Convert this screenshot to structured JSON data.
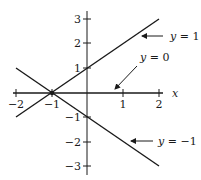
{
  "diagram": {
    "type": "coordinate-plot",
    "x_axis": {
      "label": "x",
      "ticks": [
        -2,
        -1,
        1,
        2
      ],
      "tick_labels": [
        "−2",
        "−1",
        "1",
        "2"
      ]
    },
    "y_axis": {
      "ticks": [
        3,
        2,
        1,
        -1,
        -2,
        -3
      ],
      "tick_labels": [
        "3",
        "2",
        "1",
        "−1",
        "−2",
        "−3"
      ]
    },
    "lines": [
      {
        "name": "y = 1",
        "label_var": "y",
        "label_rest": " = 1",
        "from": [
          -2,
          -1
        ],
        "to": [
          2,
          3
        ]
      },
      {
        "name": "y = 0",
        "label_var": "y",
        "label_rest": " = 0",
        "from": [
          -2,
          0
        ],
        "to": [
          2,
          0
        ]
      },
      {
        "name": "y = −1",
        "label_var": "y",
        "label_rest": " = −1",
        "from": [
          -2,
          1
        ],
        "to": [
          2,
          -3
        ]
      }
    ],
    "point": {
      "x": -1,
      "y": 0
    },
    "colors": {
      "ink": "#1a1a1a",
      "background": "#ffffff"
    }
  }
}
